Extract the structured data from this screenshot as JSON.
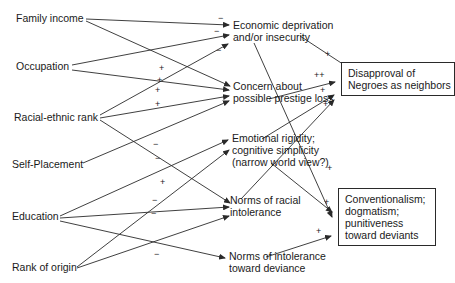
{
  "diagram": {
    "type": "path-diagram",
    "exogenous": [
      {
        "id": "family_income",
        "label": "Family income"
      },
      {
        "id": "occupation",
        "label": "Occupation"
      },
      {
        "id": "racial_ethnic_rank",
        "label": "Racial-ethnic rank"
      },
      {
        "id": "self_placement",
        "label": "Self-Placement"
      },
      {
        "id": "education",
        "label": "Education"
      },
      {
        "id": "rank_of_origin",
        "label": "Rank of origin"
      }
    ],
    "intermediate": [
      {
        "id": "econ",
        "line1": "Economic deprivation",
        "line2": "and/or insecurity"
      },
      {
        "id": "concern",
        "line1": "Concern about",
        "line2": "possible prestige loss"
      },
      {
        "id": "rigidity",
        "line1": "Emotional rigidity;",
        "line2": "cognitive simplicity",
        "line3": "(narrow world view?)"
      },
      {
        "id": "norms_racial",
        "line1": "Norms of racial",
        "line2": "intolerance"
      },
      {
        "id": "norms_deviance",
        "line1": "Norms of intolerance",
        "line2": "toward deviance"
      }
    ],
    "outcomes": [
      {
        "id": "disapproval",
        "line1": "Disapproval of",
        "line2": "Negroes as neighbors"
      },
      {
        "id": "conventionalism",
        "line1": "Conventionalism;",
        "line2": "dogmatism;",
        "line3": "punitiveness",
        "line4": "toward deviants"
      }
    ],
    "edges": [
      {
        "from": "family_income",
        "to": "econ",
        "sign": "−"
      },
      {
        "from": "family_income",
        "to": "concern",
        "sign": "+"
      },
      {
        "from": "occupation",
        "to": "econ",
        "sign": "−"
      },
      {
        "from": "occupation",
        "to": "concern",
        "sign": "+"
      },
      {
        "from": "racial_ethnic_rank",
        "to": "econ",
        "sign": "−"
      },
      {
        "from": "racial_ethnic_rank",
        "to": "concern",
        "sign": "+"
      },
      {
        "from": "racial_ethnic_rank",
        "to": "norms_racial",
        "sign": "+"
      },
      {
        "from": "self_placement",
        "to": "concern",
        "sign": "+"
      },
      {
        "from": "education",
        "to": "rigidity",
        "sign": "−"
      },
      {
        "from": "education",
        "to": "norms_racial",
        "sign": "−"
      },
      {
        "from": "education",
        "to": "norms_deviance",
        "sign": "−"
      },
      {
        "from": "rank_of_origin",
        "to": "rigidity",
        "sign": "−"
      },
      {
        "from": "rank_of_origin",
        "to": "norms_racial",
        "sign": "−"
      },
      {
        "from": "econ",
        "to": "disapproval",
        "sign": "+"
      },
      {
        "from": "econ",
        "to": "conventionalism",
        "sign": "+"
      },
      {
        "from": "concern",
        "to": "disapproval",
        "sign": "++"
      },
      {
        "from": "rigidity",
        "to": "disapproval",
        "sign": "+"
      },
      {
        "from": "rigidity",
        "to": "conventionalism",
        "sign": "+"
      },
      {
        "from": "norms_racial",
        "to": "disapproval",
        "sign": "+"
      },
      {
        "from": "norms_deviance",
        "to": "conventionalism",
        "sign": "+"
      }
    ]
  },
  "signs": {
    "s1": "−",
    "s2": "−",
    "s3": "−",
    "s4": "+",
    "s5": "+",
    "s6": "+",
    "s7": "+",
    "s8": "−",
    "s9": "−",
    "s10": "+",
    "s11": "−",
    "s12": "−",
    "s13": "−",
    "s14": "+",
    "s15": "++",
    "s16": "+",
    "s17": "+",
    "s18": "+",
    "s19": "+",
    "s20": "+"
  }
}
